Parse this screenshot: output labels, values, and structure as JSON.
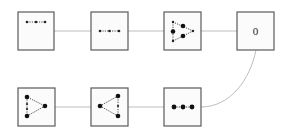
{
  "diagram": {
    "type": "flow",
    "background": "#ffffff",
    "edge_color": "#bdbdbd",
    "node_border": "#5a5a5a",
    "nodes": [
      {
        "id": "n1",
        "row": 1,
        "col": 1,
        "content": "three-dots-dotted-line-small",
        "label": ""
      },
      {
        "id": "n2",
        "row": 1,
        "col": 2,
        "content": "three-dots-dotted-line-centered",
        "label": ""
      },
      {
        "id": "n3",
        "row": 1,
        "col": 3,
        "content": "triangle-graph-right-pointing-inner-dots",
        "label": ""
      },
      {
        "id": "n4",
        "row": 1,
        "col": 4,
        "content": "text",
        "label": "0"
      },
      {
        "id": "n5",
        "row": 2,
        "col": 3,
        "content": "three-large-dots-row",
        "label": ""
      },
      {
        "id": "n6",
        "row": 2,
        "col": 2,
        "content": "triangle-graph-left-pointing",
        "label": ""
      },
      {
        "id": "n7",
        "row": 2,
        "col": 1,
        "content": "triangle-graph-right-pointing",
        "label": ""
      }
    ],
    "edges": [
      {
        "from": "n1",
        "to": "n2",
        "style": "straight"
      },
      {
        "from": "n2",
        "to": "n3",
        "style": "straight"
      },
      {
        "from": "n3",
        "to": "n4",
        "style": "straight"
      },
      {
        "from": "n4",
        "to": "n5",
        "style": "curved"
      },
      {
        "from": "n5",
        "to": "n6",
        "style": "straight"
      },
      {
        "from": "n6",
        "to": "n7",
        "style": "straight"
      }
    ]
  }
}
